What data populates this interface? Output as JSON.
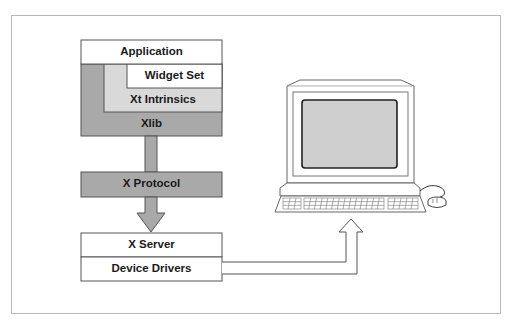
{
  "diagram": {
    "client_stack": {
      "layers": [
        {
          "id": "application",
          "label": "Application"
        },
        {
          "id": "widget-set",
          "label": "Widget Set"
        },
        {
          "id": "xt-intrinsics",
          "label": "Xt Intrinsics"
        },
        {
          "id": "xlib",
          "label": "Xlib"
        }
      ]
    },
    "protocol": {
      "label": "X Protocol"
    },
    "server_stack": {
      "layers": [
        {
          "id": "x-server",
          "label": "X Server"
        },
        {
          "id": "device-drivers",
          "label": "Device Drivers"
        }
      ]
    },
    "hardware": {
      "icon": "workstation-computer-icon",
      "parts": [
        "monitor",
        "keyboard",
        "mouse"
      ]
    },
    "colors": {
      "dark_gray": "#a9a9a9",
      "light_gray": "#d9d9d9",
      "white": "#ffffff",
      "screen": "#cfcfcf",
      "outline": "#555555"
    }
  }
}
